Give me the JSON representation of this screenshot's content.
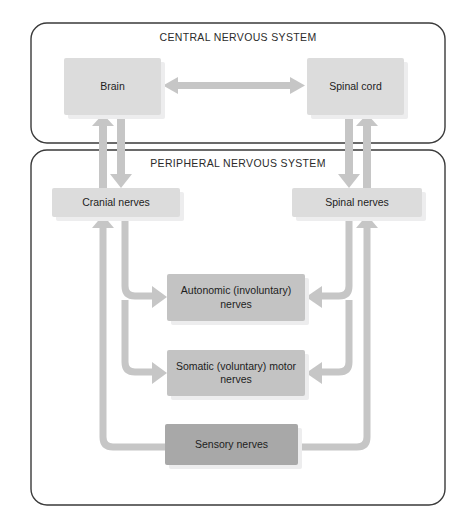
{
  "diagram": {
    "panels": [
      {
        "id": "cns",
        "label": "CENTRAL NERVOUS SYSTEM",
        "x": 31,
        "y": 23,
        "w": 414,
        "h": 120
      },
      {
        "id": "pns",
        "label": "PERIPHERAL NERVOUS SYSTEM",
        "x": 31,
        "y": 150,
        "w": 414,
        "h": 355
      }
    ],
    "nodes": [
      {
        "id": "brain",
        "label": "Brain",
        "tone": "light",
        "x": 64,
        "y": 58,
        "w": 97,
        "h": 57
      },
      {
        "id": "spinal-cord",
        "label": "Spinal cord",
        "tone": "light",
        "x": 307,
        "y": 58,
        "w": 97,
        "h": 57
      },
      {
        "id": "cranial-nerves",
        "label": "Cranial nerves",
        "tone": "light",
        "x": 52,
        "y": 188,
        "w": 128,
        "h": 29
      },
      {
        "id": "spinal-nerves",
        "label": "Spinal nerves",
        "tone": "light",
        "x": 292,
        "y": 188,
        "w": 130,
        "h": 29
      },
      {
        "id": "autonomic-nerves",
        "label": "Autonomic (involuntary) nerves",
        "tone": "mid",
        "x": 167,
        "y": 274,
        "w": 138,
        "h": 47
      },
      {
        "id": "somatic-nerves",
        "label": "Somatic (voluntary) motor nerves",
        "tone": "mid",
        "x": 167,
        "y": 350,
        "w": 138,
        "h": 46
      },
      {
        "id": "sensory-nerves",
        "label": "Sensory nerves",
        "tone": "dark",
        "x": 165,
        "y": 424,
        "w": 133,
        "h": 41
      }
    ],
    "connections": [
      {
        "id": "brain-spinalcord",
        "from": "brain",
        "to": "spinal-cord",
        "kind": "double-arrow-horizontal"
      },
      {
        "id": "cranial-to-brain",
        "from": "cranial-nerves",
        "to": "brain",
        "kind": "arrow-up"
      },
      {
        "id": "brain-to-cranial",
        "from": "brain",
        "to": "cranial-nerves",
        "kind": "arrow-down"
      },
      {
        "id": "spinal-to-spinalcord",
        "from": "spinal-nerves",
        "to": "spinal-cord",
        "kind": "arrow-up"
      },
      {
        "id": "spinalcord-to-spinal",
        "from": "spinal-cord",
        "to": "spinal-nerves",
        "kind": "arrow-down"
      },
      {
        "id": "cranial-to-autonomic",
        "from": "cranial-nerves",
        "to": "autonomic-nerves",
        "kind": "elbow-arrow-right"
      },
      {
        "id": "cranial-to-somatic",
        "from": "cranial-nerves",
        "to": "somatic-nerves",
        "kind": "elbow-arrow-right"
      },
      {
        "id": "spinal-to-autonomic",
        "from": "spinal-nerves",
        "to": "autonomic-nerves",
        "kind": "elbow-arrow-left"
      },
      {
        "id": "spinal-to-somatic",
        "from": "spinal-nerves",
        "to": "somatic-nerves",
        "kind": "elbow-arrow-left"
      },
      {
        "id": "sensory-to-cranial",
        "from": "sensory-nerves",
        "to": "cranial-nerves",
        "kind": "elbow-arrow-up-left"
      },
      {
        "id": "sensory-to-spinal",
        "from": "sensory-nerves",
        "to": "spinal-nerves",
        "kind": "elbow-arrow-up-right"
      }
    ],
    "colors": {
      "panel_border": "#3a3a3a",
      "arrow": "#c6c6c6",
      "node_light": "#dcdcdc",
      "node_mid": "#c3c3c3",
      "node_dark": "#a8a8a8",
      "text": "#1d1d1d",
      "background": "#ffffff"
    }
  }
}
